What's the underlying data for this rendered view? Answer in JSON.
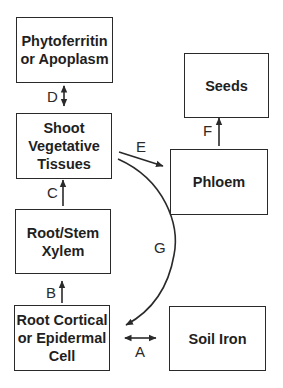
{
  "diagram": {
    "boxes": {
      "phytoferritin": "Phytoferritin\nor Apoplasm",
      "shoot": "Shoot\nVegetative\nTissues",
      "xylem": "Root/Stem\nXylem",
      "root_cell": "Root Cortical\nor Epidermal\nCell",
      "seeds": "Seeds",
      "phloem": "Phloem",
      "soil_iron": "Soil Iron"
    },
    "arrows": {
      "A": "A",
      "B": "B",
      "C": "C",
      "D": "D",
      "E": "E",
      "F": "F",
      "G": "G"
    },
    "edges": [
      {
        "label": "A",
        "from": "Root Cortical or Epidermal Cell",
        "to": "Soil Iron",
        "direction": "bidirectional"
      },
      {
        "label": "B",
        "from": "Root Cortical or Epidermal Cell",
        "to": "Root/Stem Xylem",
        "direction": "forward"
      },
      {
        "label": "C",
        "from": "Root/Stem Xylem",
        "to": "Shoot Vegetative Tissues",
        "direction": "forward"
      },
      {
        "label": "D",
        "from": "Shoot Vegetative Tissues",
        "to": "Phytoferritin or Apoplasm",
        "direction": "bidirectional"
      },
      {
        "label": "E",
        "from": "Shoot Vegetative Tissues",
        "to": "Phloem",
        "direction": "forward"
      },
      {
        "label": "F",
        "from": "Phloem",
        "to": "Seeds",
        "direction": "forward"
      },
      {
        "label": "G",
        "from": "Shoot Vegetative Tissues",
        "to": "Root Cortical or Epidermal Cell",
        "direction": "forward"
      }
    ],
    "colors": {
      "stroke": "#2a2a2a",
      "text": "#1f1f1f",
      "background": "#ffffff"
    }
  }
}
